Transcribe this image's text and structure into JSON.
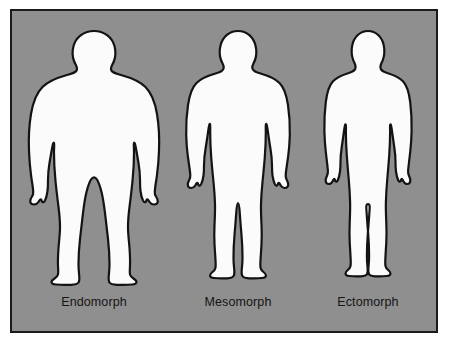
{
  "figure": {
    "background_color": "#8f8f8f",
    "border_color": "#1b1b1b",
    "silhouette_fill": "#fbfbfb",
    "silhouette_outline": "#131313",
    "label_color": "#141414"
  },
  "body_types": [
    {
      "id": "endomorph",
      "label": "Endomorph",
      "description": "Heavy, rounded, wide build silhouette"
    },
    {
      "id": "mesomorph",
      "label": "Mesomorph",
      "description": "Muscular, athletic, medium build silhouette"
    },
    {
      "id": "ectomorph",
      "label": "Ectomorph",
      "description": "Slim, narrow, lean build silhouette"
    }
  ]
}
